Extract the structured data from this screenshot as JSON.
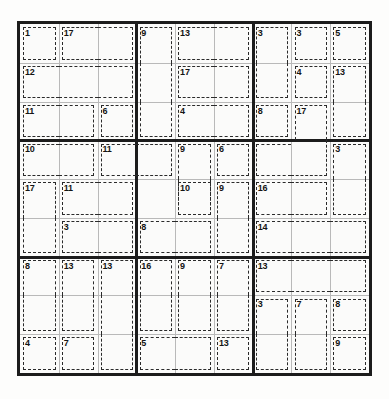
{
  "puzzle": {
    "type": "killer-sudoku",
    "grid_size": 9,
    "box_size": 3,
    "cell_px": 38.7,
    "given_values": [],
    "cages": [
      {
        "id": "c1",
        "sum": "1",
        "cells": [
          [
            1,
            1
          ]
        ]
      },
      {
        "id": "c2",
        "sum": "17",
        "cells": [
          [
            1,
            2
          ],
          [
            1,
            3
          ]
        ]
      },
      {
        "id": "c3",
        "sum": "9",
        "cells": [
          [
            1,
            4
          ],
          [
            2,
            4
          ],
          [
            3,
            4
          ]
        ]
      },
      {
        "id": "c4",
        "sum": "13",
        "cells": [
          [
            1,
            5
          ],
          [
            1,
            6
          ]
        ]
      },
      {
        "id": "c5",
        "sum": "3",
        "cells": [
          [
            1,
            7
          ],
          [
            2,
            7
          ]
        ]
      },
      {
        "id": "c6",
        "sum": "3",
        "cells": [
          [
            1,
            8
          ]
        ]
      },
      {
        "id": "c7",
        "sum": "5",
        "cells": [
          [
            1,
            9
          ]
        ]
      },
      {
        "id": "c8",
        "sum": "12",
        "cells": [
          [
            2,
            1
          ],
          [
            2,
            2
          ],
          [
            2,
            3
          ]
        ]
      },
      {
        "id": "c9",
        "sum": "17",
        "cells": [
          [
            2,
            5
          ],
          [
            2,
            6
          ]
        ]
      },
      {
        "id": "c10",
        "sum": "4",
        "cells": [
          [
            2,
            8
          ]
        ]
      },
      {
        "id": "c11",
        "sum": "13",
        "cells": [
          [
            2,
            9
          ],
          [
            3,
            9
          ]
        ]
      },
      {
        "id": "c12",
        "sum": "11",
        "cells": [
          [
            3,
            1
          ],
          [
            3,
            2
          ]
        ]
      },
      {
        "id": "c13",
        "sum": "6",
        "cells": [
          [
            3,
            3
          ]
        ]
      },
      {
        "id": "c14",
        "sum": "4",
        "cells": [
          [
            3,
            5
          ],
          [
            3,
            6
          ]
        ]
      },
      {
        "id": "c15",
        "sum": "8",
        "cells": [
          [
            3,
            7
          ]
        ]
      },
      {
        "id": "c16",
        "sum": "17",
        "cells": [
          [
            3,
            8
          ],
          [
            4,
            8
          ],
          [
            4,
            7
          ]
        ]
      },
      {
        "id": "c17",
        "sum": "10",
        "cells": [
          [
            4,
            1
          ],
          [
            4,
            2
          ]
        ]
      },
      {
        "id": "c18",
        "sum": "11",
        "cells": [
          [
            4,
            3
          ],
          [
            4,
            4
          ]
        ]
      },
      {
        "id": "c19",
        "sum": "9",
        "cells": [
          [
            4,
            5
          ],
          [
            5,
            5
          ]
        ]
      },
      {
        "id": "c20",
        "sum": "6",
        "cells": [
          [
            4,
            6
          ]
        ]
      },
      {
        "id": "c21",
        "sum": "3",
        "cells": [
          [
            4,
            9
          ],
          [
            5,
            9
          ]
        ]
      },
      {
        "id": "c22",
        "sum": "17",
        "cells": [
          [
            5,
            1
          ],
          [
            6,
            1
          ]
        ]
      },
      {
        "id": "c23",
        "sum": "11",
        "cells": [
          [
            5,
            2
          ],
          [
            5,
            3
          ]
        ]
      },
      {
        "id": "c24",
        "sum": "10",
        "cells": [
          [
            5,
            5
          ]
        ]
      },
      {
        "id": "c25",
        "sum": "9",
        "cells": [
          [
            5,
            6
          ],
          [
            6,
            6
          ]
        ]
      },
      {
        "id": "c26",
        "sum": "16",
        "cells": [
          [
            5,
            7
          ],
          [
            5,
            8
          ]
        ]
      },
      {
        "id": "c27",
        "sum": "3",
        "cells": [
          [
            6,
            2
          ],
          [
            6,
            3
          ]
        ]
      },
      {
        "id": "c28",
        "sum": "8",
        "cells": [
          [
            6,
            4
          ],
          [
            6,
            5
          ]
        ]
      },
      {
        "id": "c29",
        "sum": "14",
        "cells": [
          [
            6,
            7
          ],
          [
            6,
            8
          ],
          [
            6,
            9
          ]
        ]
      },
      {
        "id": "c30",
        "sum": "8",
        "cells": [
          [
            7,
            1
          ],
          [
            8,
            1
          ]
        ]
      },
      {
        "id": "c31",
        "sum": "13",
        "cells": [
          [
            7,
            2
          ],
          [
            8,
            2
          ]
        ]
      },
      {
        "id": "c32",
        "sum": "13",
        "cells": [
          [
            7,
            3
          ],
          [
            8,
            3
          ],
          [
            9,
            3
          ]
        ]
      },
      {
        "id": "c33",
        "sum": "16",
        "cells": [
          [
            7,
            4
          ],
          [
            8,
            4
          ]
        ]
      },
      {
        "id": "c34",
        "sum": "9",
        "cells": [
          [
            7,
            5
          ],
          [
            8,
            5
          ]
        ]
      },
      {
        "id": "c35",
        "sum": "7",
        "cells": [
          [
            7,
            6
          ],
          [
            8,
            6
          ]
        ]
      },
      {
        "id": "c36",
        "sum": "13",
        "cells": [
          [
            7,
            7
          ],
          [
            7,
            8
          ],
          [
            7,
            9
          ]
        ]
      },
      {
        "id": "c37",
        "sum": "3",
        "cells": [
          [
            8,
            7
          ],
          [
            9,
            7
          ]
        ]
      },
      {
        "id": "c38",
        "sum": "7",
        "cells": [
          [
            8,
            8
          ],
          [
            9,
            8
          ]
        ]
      },
      {
        "id": "c39",
        "sum": "8",
        "cells": [
          [
            8,
            9
          ]
        ]
      },
      {
        "id": "c40",
        "sum": "4",
        "cells": [
          [
            9,
            1
          ]
        ]
      },
      {
        "id": "c41",
        "sum": "7",
        "cells": [
          [
            9,
            2
          ]
        ]
      },
      {
        "id": "c42",
        "sum": "5",
        "cells": [
          [
            9,
            4
          ],
          [
            9,
            5
          ]
        ]
      },
      {
        "id": "c43",
        "sum": "13",
        "cells": [
          [
            9,
            6
          ]
        ]
      },
      {
        "id": "c44",
        "sum": "9",
        "cells": [
          [
            9,
            9
          ]
        ]
      }
    ]
  },
  "colors": {
    "grid_border": "#1c1c1c",
    "cell_line": "#b9b9b9",
    "cage_dash": "#2a2a2a",
    "text": "#141414",
    "background": "#ffffff",
    "cell_fill": "#fbfbfa"
  }
}
